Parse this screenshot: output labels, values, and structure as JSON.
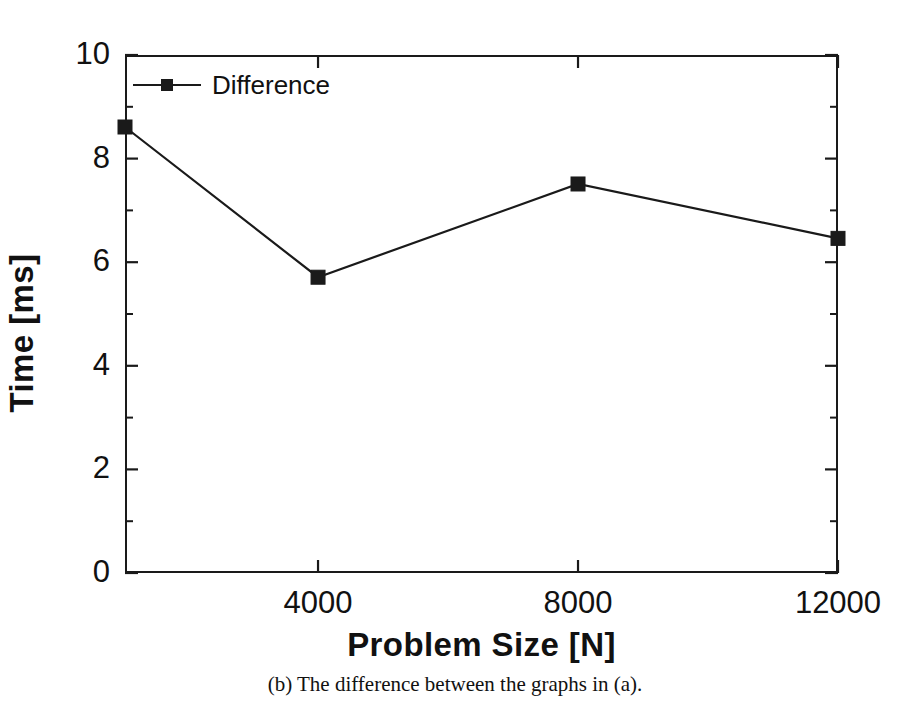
{
  "figure": {
    "caption": "(b) The difference between the graphs in (a)."
  },
  "chart_data": {
    "type": "line",
    "title": "",
    "xlabel": "Problem Size [N]",
    "ylabel": "Time [ms]",
    "xlim": [
      1030,
      12000
    ],
    "ylim": [
      0,
      10
    ],
    "grid": false,
    "legend_position": "top-left-inside",
    "x_ticks": [
      4000,
      8000,
      12000
    ],
    "x_tick_labels": [
      "4000",
      "8000",
      "12000"
    ],
    "y_ticks": [
      0,
      2,
      4,
      6,
      8,
      10
    ],
    "y_tick_labels": [
      "0",
      "2",
      "4",
      "6",
      "8",
      "10"
    ],
    "y_minor_ticks": [
      1,
      3,
      5,
      7,
      9
    ],
    "x_minor_ticks": [
      2000,
      6000,
      10000
    ],
    "series": [
      {
        "name": "Difference",
        "marker": "filled-square",
        "color": "#1a1a1a",
        "x": [
          1030,
          4000,
          8000,
          12000
        ],
        "y": [
          8.61,
          5.71,
          7.51,
          6.46
        ]
      }
    ]
  }
}
